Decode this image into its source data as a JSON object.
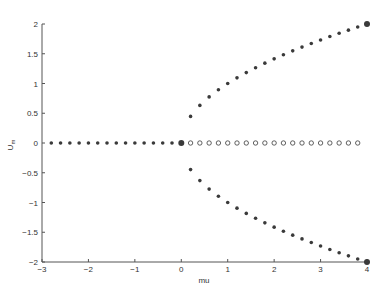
{
  "chart_data": {
    "type": "scatter",
    "title": "",
    "xlabel": "mu",
    "ylabel": "U_m",
    "xlim": [
      -3,
      4
    ],
    "ylim": [
      -2,
      2
    ],
    "xticks": [
      -3,
      -2,
      -1,
      0,
      1,
      2,
      3,
      4
    ],
    "yticks": [
      -2,
      -1.5,
      -1,
      -0.5,
      0,
      0.5,
      1,
      1.5,
      2
    ],
    "grid": false,
    "legend": null,
    "series": [
      {
        "name": "stable zero branch (mu<0)",
        "marker": "filled-dot",
        "x": [
          -2.8,
          -2.6,
          -2.4,
          -2.2,
          -2.0,
          -1.8,
          -1.6,
          -1.4,
          -1.2,
          -1.0,
          -0.8,
          -0.6,
          -0.4,
          -0.2
        ],
        "y": [
          0,
          0,
          0,
          0,
          0,
          0,
          0,
          0,
          0,
          0,
          0,
          0,
          0,
          0
        ]
      },
      {
        "name": "unstable zero branch (mu>0)",
        "marker": "open-circle",
        "x": [
          0.2,
          0.4,
          0.6,
          0.8,
          1.0,
          1.2,
          1.4,
          1.6,
          1.8,
          2.0,
          2.2,
          2.4,
          2.6,
          2.8,
          3.0,
          3.2,
          3.4,
          3.6,
          3.8
        ],
        "y": [
          0,
          0,
          0,
          0,
          0,
          0,
          0,
          0,
          0,
          0,
          0,
          0,
          0,
          0,
          0,
          0,
          0,
          0,
          0
        ]
      },
      {
        "name": "upper branch +sqrt(mu)",
        "marker": "filled-dot",
        "x": [
          0.2,
          0.4,
          0.6,
          0.8,
          1.0,
          1.2,
          1.4,
          1.6,
          1.8,
          2.0,
          2.2,
          2.4,
          2.6,
          2.8,
          3.0,
          3.2,
          3.4,
          3.6,
          3.8
        ],
        "y": [
          0.447,
          0.632,
          0.775,
          0.894,
          1.0,
          1.095,
          1.183,
          1.265,
          1.342,
          1.414,
          1.483,
          1.549,
          1.612,
          1.673,
          1.732,
          1.789,
          1.844,
          1.897,
          1.949
        ]
      },
      {
        "name": "lower branch -sqrt(mu)",
        "marker": "filled-dot",
        "x": [
          0.2,
          0.4,
          0.6,
          0.8,
          1.0,
          1.2,
          1.4,
          1.6,
          1.8,
          2.0,
          2.2,
          2.4,
          2.6,
          2.8,
          3.0,
          3.2,
          3.4,
          3.6,
          3.8
        ],
        "y": [
          -0.447,
          -0.632,
          -0.775,
          -0.894,
          -1.0,
          -1.095,
          -1.183,
          -1.265,
          -1.342,
          -1.414,
          -1.483,
          -1.549,
          -1.612,
          -1.673,
          -1.732,
          -1.789,
          -1.844,
          -1.897,
          -1.949
        ]
      },
      {
        "name": "highlighted points",
        "marker": "large-filled-dot",
        "x": [
          0,
          4,
          4
        ],
        "y": [
          0,
          2,
          -2
        ]
      }
    ]
  },
  "labels": {
    "xlabel": "mu",
    "ylabel_main": "U",
    "ylabel_sub": "m"
  },
  "colors": {
    "marker": "#3a3a3a",
    "axis": "#555555"
  }
}
